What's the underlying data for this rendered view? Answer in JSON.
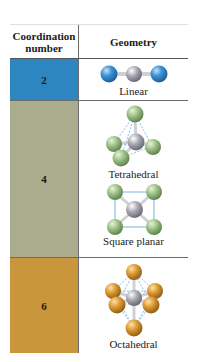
{
  "table": {
    "headers": {
      "coordination": "Coordination number",
      "geometry": "Geometry"
    },
    "rows": [
      {
        "coordination_number": "2",
        "color": "#2e86c1",
        "geometries": [
          {
            "label": "Linear",
            "icon": "linear-molecule-icon"
          }
        ]
      },
      {
        "coordination_number": "4",
        "color": "#a9ad8e",
        "geometries": [
          {
            "label": "Tetrahedral",
            "icon": "tetrahedral-molecule-icon"
          },
          {
            "label": "Square planar",
            "icon": "square-planar-molecule-icon"
          }
        ]
      },
      {
        "coordination_number": "6",
        "color": "#c9963e",
        "geometries": [
          {
            "label": "Octahedral",
            "icon": "octahedral-molecule-icon"
          }
        ]
      }
    ]
  },
  "colors": {
    "ligand_blue": "#2b7fc4",
    "ligand_green": "#9bbd84",
    "ligand_orange": "#d9972e",
    "metal_gray": "#9a9aa6"
  }
}
